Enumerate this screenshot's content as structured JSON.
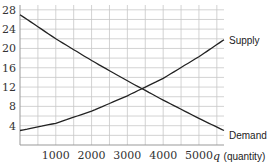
{
  "chart_data": {
    "type": "line",
    "title": "",
    "xlabel": "q (quantity)",
    "xlabel_var": "q",
    "xlabel_text": "(quantity)",
    "ylabel": "",
    "xlim": [
      0,
      5700
    ],
    "ylim": [
      0,
      29
    ],
    "x_ticks": [
      1000,
      2000,
      3000,
      4000,
      5000
    ],
    "y_ticks": [
      4,
      8,
      12,
      16,
      20,
      24,
      28
    ],
    "grid": true,
    "x_grid_step": 500,
    "y_grid_step": 2,
    "legend": "inline labels at right end of curves",
    "series": [
      {
        "name": "Supply",
        "x": [
          0,
          1000,
          2000,
          3000,
          4000,
          5000,
          5700
        ],
        "values": [
          3,
          4.5,
          7,
          10.2,
          13.8,
          18.3,
          21.8
        ]
      },
      {
        "name": "Demand",
        "x": [
          0,
          1000,
          2000,
          3000,
          4000,
          5000,
          5700
        ],
        "values": [
          27,
          22,
          17.5,
          13.3,
          9.3,
          5.5,
          3
        ]
      }
    ],
    "annotations": [
      "Supply",
      "Demand"
    ]
  }
}
